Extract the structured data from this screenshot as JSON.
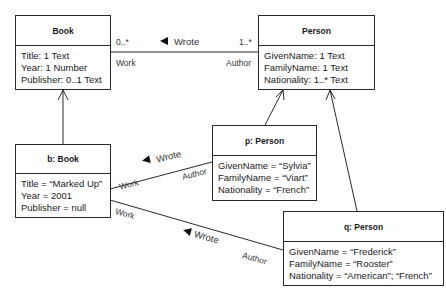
{
  "classes": {
    "book": {
      "title": "Book",
      "attributes": [
        "Title: 1 Text",
        "Year: 1 Number",
        "Publisher: 0..1 Text"
      ]
    },
    "person": {
      "title": "Person",
      "attributes": [
        "GivenName: 1 Text",
        "FamilyName: 1 Text",
        "Nationality: 1..* Text"
      ]
    }
  },
  "objects": {
    "b_book": {
      "title": "b: Book",
      "attributes": [
        "Title = “Marked Up”",
        "Year = 2001",
        "Publisher = null"
      ]
    },
    "p_person": {
      "title": "p: Person",
      "attributes": [
        "GivenName = “Sylvia”",
        "FamilyName = “Viart”",
        "Nationality = “French”"
      ]
    },
    "q_person": {
      "title": "q: Person",
      "attributes": [
        "GivenName = “Frederick”",
        "FamilyName = “Rooster”",
        "Nationality = “American”; “French”"
      ]
    }
  },
  "associations": {
    "class_assoc": {
      "name": "Wrote",
      "left_multiplicity": "0..*",
      "left_role": "Work",
      "right_multiplicity": "1..*",
      "right_role": "Author",
      "direction_icon": "triangle-left-icon"
    },
    "link_p": {
      "name": "Wrote",
      "left_role": "Work",
      "right_role": "Author",
      "direction_icon": "triangle-left-icon"
    },
    "link_q": {
      "name": "Wrote",
      "left_role": "Work",
      "right_role": "Author",
      "direction_icon": "triangle-left-icon"
    }
  },
  "instance_of": [
    {
      "from": "b: Book",
      "to": "Book"
    },
    {
      "from": "p: Person",
      "to": "Person"
    },
    {
      "from": "q: Person",
      "to": "Person"
    }
  ],
  "colors": {
    "line": "#2a2a2a",
    "background": "#ffffff",
    "text": "#1a1a1a"
  }
}
